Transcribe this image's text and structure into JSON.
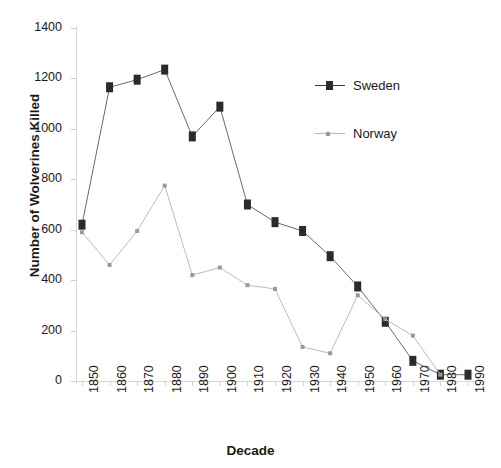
{
  "chart_data": {
    "type": "line",
    "title": "",
    "xlabel": "Decade",
    "ylabel": "Number of Wolverines Killed",
    "categories": [
      1850,
      1860,
      1870,
      1880,
      1890,
      1900,
      1910,
      1920,
      1930,
      1940,
      1950,
      1960,
      1970,
      1980,
      1990
    ],
    "xtick_labels": [
      "1850",
      "1860",
      "1870",
      "1880",
      "1890",
      "1900",
      "1910",
      "1920",
      "1930",
      "1940",
      "1950",
      "1960",
      "1970",
      "1980",
      "1990"
    ],
    "ytick_labels": [
      "0",
      "200",
      "400",
      "600",
      "800",
      "1000",
      "1200",
      "1400"
    ],
    "yticks": [
      0,
      200,
      400,
      600,
      800,
      1000,
      1200,
      1400
    ],
    "ylim": [
      0,
      1400
    ],
    "xlim": [
      1850,
      1990
    ],
    "grid": false,
    "legend_position": "upper-right-inside",
    "series": [
      {
        "name": "Sweden",
        "marker": "square",
        "color": "#2b2b2b",
        "line_color": "#6a6a6a",
        "values": [
          620,
          1165,
          1195,
          1235,
          970,
          1088,
          700,
          630,
          595,
          495,
          375,
          235,
          80,
          25,
          25
        ]
      },
      {
        "name": "Norway",
        "marker": "small-plus",
        "color": "#9a9a9a",
        "line_color": "#bcbcbc",
        "values": [
          590,
          460,
          595,
          775,
          420,
          450,
          380,
          365,
          135,
          110,
          340,
          245,
          180,
          25,
          null
        ]
      }
    ]
  },
  "legend": {
    "items": [
      {
        "label": "Sweden"
      },
      {
        "label": "Norway"
      }
    ]
  },
  "axes": {
    "y_title": "Number of Wolverines Killed",
    "x_title": "Decade"
  }
}
